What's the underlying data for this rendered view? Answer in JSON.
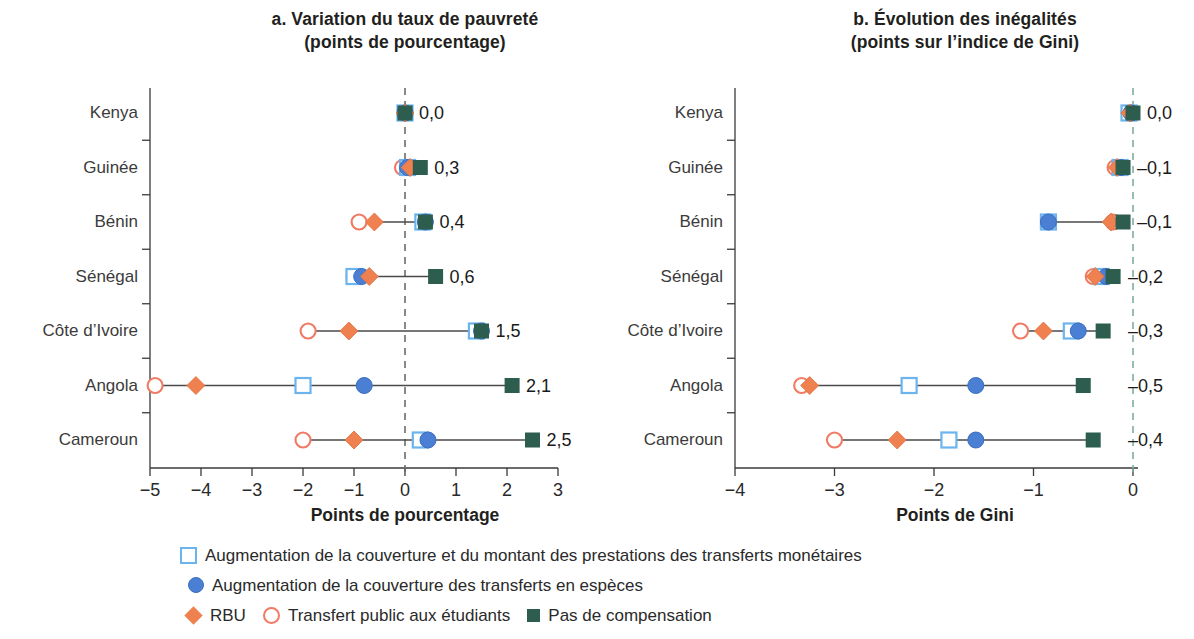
{
  "panels": [
    {
      "key": "a",
      "title_line1": "a. Variation du taux de pauvreté",
      "title_line2": "(points de pourcentage)",
      "axis_label": "Points de pourcentage"
    },
    {
      "key": "b",
      "title_line1": "b. Évolution des inégalités",
      "title_line2": "(points sur l’indice de Gini)",
      "axis_label": "Points de Gini"
    }
  ],
  "legend": {
    "rows": [
      [
        {
          "marker": "open-square",
          "label": "Augmentation de la couverture et du montant des prestations des transferts monétaires"
        }
      ],
      [
        {
          "marker": "blue-circle",
          "label": "Augmentation de la couverture des transferts en espèces"
        }
      ],
      [
        {
          "marker": "orange-diamond",
          "label": "RBU"
        },
        {
          "marker": "open-circle",
          "label": "Transfert public aux étudiants"
        },
        {
          "marker": "green-square",
          "label": "Pas de compensation"
        }
      ]
    ]
  },
  "colors": {
    "open_square_stroke": "#6cb4ee",
    "blue_circle_fill": "#4a7fd4",
    "orange_diamond_fill": "#ef8050",
    "open_circle_stroke": "#f07a63",
    "green_square_fill": "#2d5d4e",
    "connector_line": "#4a4a4a",
    "zero_line_a": "#6b6b6b",
    "zero_line_b": "#7fae9f",
    "axis": "#3a3a3a"
  },
  "chart_data": [
    {
      "type": "scatter",
      "panel": "a",
      "title": "a. Variation du taux de pauvreté (points de pourcentage)",
      "xlabel": "Points de pourcentage",
      "ylabel": "",
      "xlim": [
        -5,
        3
      ],
      "xticks": [
        -5,
        -4,
        -3,
        -2,
        -1,
        0,
        1,
        2,
        3
      ],
      "xticklabels": [
        "−5",
        "−4",
        "−3",
        "−2",
        "−1",
        "0",
        "1",
        "2",
        "3"
      ],
      "categories": [
        "Kenya",
        "Guinée",
        "Bénin",
        "Sénégal",
        "Côte d’Ivoire",
        "Angola",
        "Cameroun"
      ],
      "grid": false,
      "zero_reference_line": 0,
      "legend_position": "bottom",
      "series": [
        {
          "name": "Augmentation de la couverture et du montant des prestations des transferts monétaires",
          "marker": "open-square",
          "values": [
            0.0,
            0.05,
            0.35,
            -1.0,
            1.4,
            -2.0,
            0.3
          ]
        },
        {
          "name": "Augmentation de la couverture des transferts en espèces",
          "marker": "blue-circle",
          "values": [
            0.0,
            0.05,
            0.4,
            -0.85,
            1.5,
            -0.8,
            0.45
          ]
        },
        {
          "name": "RBU",
          "marker": "orange-diamond",
          "values": [
            0.0,
            0.1,
            -0.6,
            -0.7,
            -1.1,
            -4.1,
            -1.0
          ]
        },
        {
          "name": "Transfert public aux étudiants",
          "marker": "open-circle",
          "values": [
            0.0,
            -0.05,
            -0.9,
            -1.0,
            -1.9,
            -4.9,
            -2.0
          ]
        },
        {
          "name": "Pas de compensation",
          "marker": "green-square",
          "values": [
            0.0,
            0.3,
            0.4,
            0.6,
            1.5,
            2.1,
            2.5
          ]
        }
      ],
      "value_labels": [
        "0,0",
        "0,3",
        "0,4",
        "0,6",
        "1,5",
        "2,1",
        "2,5"
      ]
    },
    {
      "type": "scatter",
      "panel": "b",
      "title": "b. Évolution des inégalités (points sur l’indice de Gini)",
      "xlabel": "Points de Gini",
      "ylabel": "",
      "xlim": [
        -4.2,
        0.2
      ],
      "xticks": [
        -4,
        -3,
        -2,
        -1,
        0
      ],
      "xticklabels": [
        "−4",
        "−3",
        "−2",
        "−1",
        "0"
      ],
      "categories": [
        "Kenya",
        "Guinée",
        "Bénin",
        "Sénégal",
        "Côte d’Ivoire",
        "Angola",
        "Cameroun"
      ],
      "grid": false,
      "zero_reference_line": 0,
      "legend_position": "bottom",
      "series": [
        {
          "name": "Augmentation de la couverture et du montant des prestations des transferts monétaires",
          "marker": "open-square",
          "values": [
            -0.04,
            -0.13,
            -0.85,
            -0.32,
            -0.62,
            -2.25,
            -1.85
          ]
        },
        {
          "name": "Augmentation de la couverture des transferts en espèces",
          "marker": "blue-circle",
          "values": [
            -0.02,
            -0.12,
            -0.85,
            -0.27,
            -0.55,
            -1.58,
            -1.58
          ]
        },
        {
          "name": "RBU",
          "marker": "orange-diamond",
          "values": [
            -0.03,
            -0.16,
            -0.22,
            -0.38,
            -0.9,
            -3.25,
            -2.37
          ]
        },
        {
          "name": "Transfert public aux étudiants",
          "marker": "open-circle",
          "values": [
            -0.04,
            -0.18,
            -0.2,
            -0.4,
            -1.13,
            -3.33,
            -3.0
          ]
        },
        {
          "name": "Pas de compensation",
          "marker": "green-square",
          "values": [
            0.0,
            -0.1,
            -0.1,
            -0.2,
            -0.3,
            -0.5,
            -0.4
          ]
        }
      ],
      "value_labels": [
        "0,0",
        "–0,1",
        "–0,1",
        "–0,2",
        "–0,3",
        "–0,5",
        "–0,4"
      ]
    }
  ]
}
